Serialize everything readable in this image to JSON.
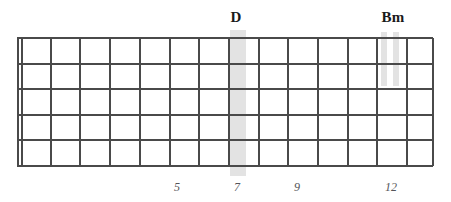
{
  "diagram": {
    "type": "guitar-fretboard",
    "strings": 6,
    "frets": 14,
    "line_color": "#4a4a4a",
    "highlight_color": "#d9d9d9",
    "label_color": "#1a1a1a",
    "fret_number_color": "#55555a",
    "background_color": "#ffffff"
  },
  "board": {
    "left": 17,
    "right": 433,
    "top": 38,
    "bottom": 166,
    "nut_x": 17,
    "nut_inner_x": 21,
    "fret_spacing": 29.7,
    "string_y": [
      38,
      63.6,
      89.2,
      114.8,
      140.4,
      166
    ],
    "fret_x": [
      50.7,
      80.4,
      110.1,
      139.8,
      169.5,
      199.2,
      228.9,
      258.6,
      288.3,
      318.0,
      347.7,
      377.4,
      407.1,
      433
    ]
  },
  "chord_markers": [
    {
      "label": "D",
      "label_x": 236,
      "label_y": 10,
      "fret": 7,
      "band_x": 230,
      "band_width": 16,
      "band_top": 30,
      "band_height": 146,
      "full_height": true
    },
    {
      "label": "Bm",
      "label_x": 393,
      "label_y": 10,
      "fret": 12,
      "band_x": 381,
      "band_width": 6,
      "band_top": 32,
      "band_height": 54,
      "full_height": false
    },
    {
      "label": "",
      "label_x": 0,
      "label_y": 0,
      "fret": 12,
      "band_x": 393,
      "band_width": 6,
      "band_top": 32,
      "band_height": 54,
      "full_height": false
    }
  ],
  "fret_numbers": [
    {
      "value": "5",
      "x": 177,
      "y": 181
    },
    {
      "value": "7",
      "x": 237,
      "y": 181
    },
    {
      "value": "9",
      "x": 297,
      "y": 181
    },
    {
      "value": "12",
      "x": 391,
      "y": 181
    }
  ]
}
